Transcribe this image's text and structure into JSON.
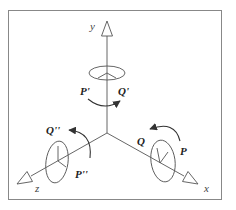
{
  "diagram": {
    "title": "",
    "colors": {
      "line": "#555555",
      "frame": "#888888",
      "text": "#222222",
      "background": "#ffffff"
    },
    "axes": [
      {
        "name": "y",
        "label": "y"
      },
      {
        "name": "x",
        "label": "x"
      },
      {
        "name": "z",
        "label": "z"
      }
    ],
    "rotations": [
      {
        "axis": "y",
        "from_label": "P'",
        "to_label": "Q'"
      },
      {
        "axis": "x",
        "from_label": "P",
        "to_label": "Q"
      },
      {
        "axis": "z",
        "from_label": "P''",
        "to_label": "Q''"
      }
    ]
  }
}
